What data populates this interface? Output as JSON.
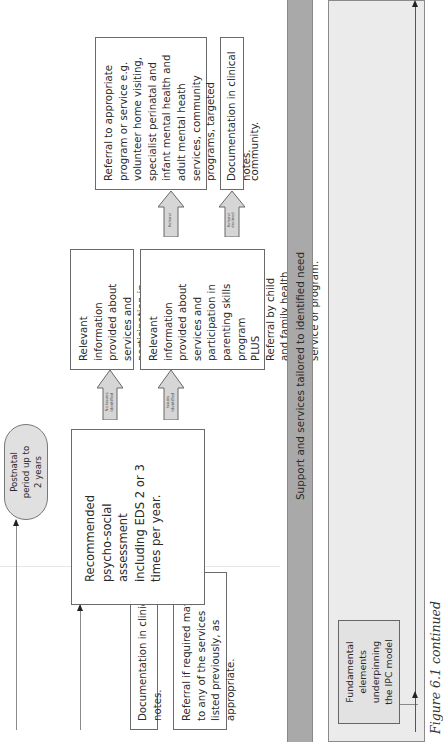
{
  "nodes": {
    "postnatal": "Postnatal period up to 2 years",
    "recommended_assessment": "Recommended psycho-social assessment including EDS 2 or 3 times per year.",
    "documentation_bottom": "Documentation in clinical notes.",
    "referral_if_required": "Referral if required may be to any of the services listed previously, as appropriate.",
    "relevant_info_no_issues": "Relevant information provided about services and participation in parenting skills program.",
    "relevant_info_issues_line1": "Relevant information provided about services and participation in parenting skills program",
    "relevant_info_issues_plus": "PLUS",
    "relevant_info_issues_line2": "Referral by child and family health nurse to approriate service or program.",
    "referral_appropriate": "Referral to appropriate program or service e.g. volunteer home visiting, specialist perinatal and infant mental health and adult mental heath services, community programs, targeted parenting program, mothers in the community.",
    "documentation_top": "Documentation in clinical notes.",
    "fundamental_elements": "Fundamental elements underpinning the IPC model"
  },
  "arrows": {
    "no_issues": "No issues identified",
    "issues": "Issues identified",
    "referral": "Referral",
    "referral_declined": "Referral declined"
  },
  "bars": {
    "support_services": "Support and services tailored to identified need"
  },
  "caption": "Figure 6.1 continued",
  "colors": {
    "bar": "#a9a9a9",
    "panel": "#ebebeb",
    "ellipse": "#e0e0e0",
    "arrow_fill": "#d6d6d6"
  }
}
